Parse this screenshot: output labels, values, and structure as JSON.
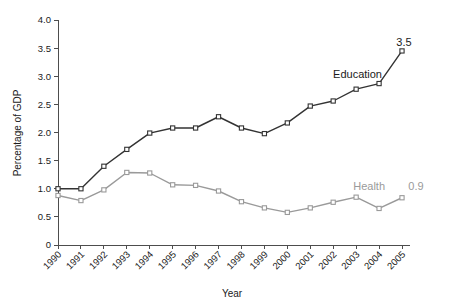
{
  "chart_data": {
    "type": "line",
    "title": "",
    "xlabel": "Year",
    "ylabel": "Percentage of GDP",
    "categories": [
      "1990",
      "1991",
      "1992",
      "1993",
      "1994",
      "1995",
      "1996",
      "1997",
      "1998",
      "1999",
      "2000",
      "2001",
      "2002",
      "2003",
      "2004",
      "2005"
    ],
    "x": [
      1990,
      1991,
      1992,
      1993,
      1994,
      1995,
      1996,
      1997,
      1998,
      1999,
      2000,
      2001,
      2002,
      2003,
      2004,
      2005
    ],
    "ylim": [
      0,
      4.0
    ],
    "yticks": [
      "0",
      "0.5",
      "1.0",
      "1.5",
      "2.0",
      "2.5",
      "3.0",
      "3.5",
      "4.0"
    ],
    "ytick_values": [
      0,
      0.5,
      1.0,
      1.5,
      2.0,
      2.5,
      3.0,
      3.5,
      4.0
    ],
    "grid": false,
    "legend_position": "inline-annotation",
    "series": [
      {
        "name": "Education",
        "color": "#333333",
        "marker": "square-open",
        "values": [
          1.0,
          1.0,
          1.4,
          1.7,
          1.99,
          2.08,
          2.08,
          2.28,
          2.08,
          1.98,
          2.17,
          2.47,
          2.56,
          2.77,
          2.87,
          3.45
        ],
        "label": "Education",
        "end_value_label": "3.5"
      },
      {
        "name": "Health",
        "color": "#9a9a9a",
        "marker": "square-open",
        "values": [
          0.88,
          0.79,
          0.98,
          1.29,
          1.28,
          1.07,
          1.06,
          0.96,
          0.77,
          0.66,
          0.58,
          0.66,
          0.76,
          0.85,
          0.65,
          0.84
        ],
        "label": "Health",
        "end_value_label": "0.9"
      }
    ],
    "annotations": [
      {
        "text": "Education",
        "series": "Education",
        "color": "#1a1a1a"
      },
      {
        "text": "Health",
        "series": "Health",
        "color": "#9a9a9a"
      },
      {
        "text": "3.5",
        "series": "Education",
        "color": "#1a1a1a"
      },
      {
        "text": "0.9",
        "series": "Health",
        "color": "#9a9a9a"
      }
    ]
  },
  "labels": {
    "ylabel": "Percentage of GDP",
    "xlabel": "Year",
    "education": "Education",
    "health": "Health",
    "education_end_value": "3.5",
    "health_end_value": "0.9"
  }
}
